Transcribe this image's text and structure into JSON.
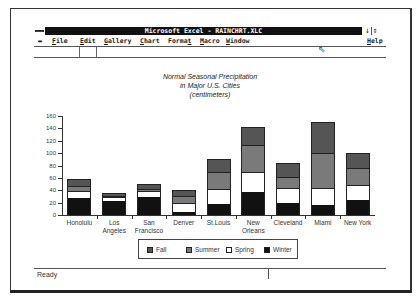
{
  "window": {
    "title": "Microsoft Excel - RAINCHRT.XLC",
    "minimize_icon": "↓",
    "restore_icon": "⇕"
  },
  "menu": {
    "control_icon": "control-menu",
    "items": [
      {
        "label": "File",
        "u": "F",
        "rest": "ile"
      },
      {
        "label": "Edit",
        "u": "E",
        "rest": "dit"
      },
      {
        "label": "Gallery",
        "u": "G",
        "rest": "allery"
      },
      {
        "label": "Chart",
        "u": "C",
        "rest": "hart"
      },
      {
        "label": "Format",
        "u": "",
        "rest": "Format"
      },
      {
        "label": "Macro",
        "u": "M",
        "rest": "acro"
      },
      {
        "label": "Window",
        "u": "W",
        "rest": "indow"
      }
    ],
    "help": {
      "label": "Help",
      "u": "H",
      "rest": "elp"
    }
  },
  "status": {
    "text": "Ready"
  },
  "chart_data": {
    "type": "bar",
    "stacked": true,
    "title": "Normal Seasonal Precipitation in Major U.S. Cities (centimeters)",
    "title_lines": [
      "Normal Seasonal Precipitation",
      "in Major U.S. Cities",
      "(centimeters)"
    ],
    "xlabel": "",
    "ylabel": "",
    "ylim": [
      0,
      160
    ],
    "yticks": [
      0,
      20,
      40,
      60,
      80,
      100,
      120,
      140,
      160
    ],
    "categories": [
      "Honolulu",
      "Los Angeles",
      "San Francisco",
      "Denver",
      "St.Louis",
      "New Orleans",
      "Cleveland",
      "Miami",
      "New York"
    ],
    "category_lines": [
      [
        "Honolulu"
      ],
      [
        "Los",
        "Angeles"
      ],
      [
        "San",
        "Francisco"
      ],
      [
        "Denver"
      ],
      [
        "St.Louis"
      ],
      [
        "New",
        "Orleans"
      ],
      [
        "Cleveland"
      ],
      [
        "Miami"
      ],
      [
        "New York"
      ]
    ],
    "series": [
      {
        "name": "Winter",
        "color": "#111111",
        "values": [
          27,
          22,
          29,
          5,
          18,
          37,
          20,
          16,
          24
        ]
      },
      {
        "name": "Spring",
        "color": "#ffffff",
        "values": [
          12,
          7,
          10,
          14,
          24,
          32,
          24,
          28,
          24
        ]
      },
      {
        "name": "Summer",
        "color": "#7a7a7a",
        "values": [
          8,
          2,
          3,
          12,
          27,
          44,
          17,
          56,
          28
        ]
      },
      {
        "name": "Fall",
        "color": "#555555",
        "values": [
          11,
          5,
          8,
          9,
          21,
          29,
          23,
          50,
          24
        ]
      }
    ],
    "legend": [
      "Fall",
      "Summer",
      "Spring",
      "Winter"
    ],
    "legend_position": "bottom",
    "grid": false
  }
}
